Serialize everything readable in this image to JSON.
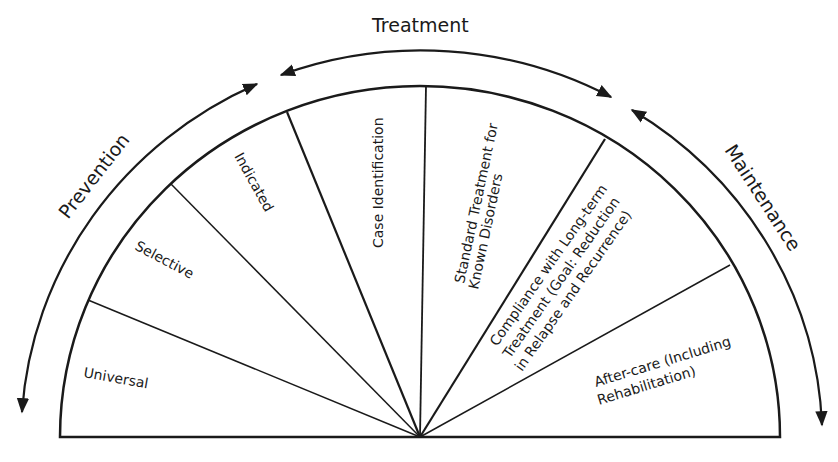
{
  "diagram": {
    "type": "semicircular spectrum diagram",
    "phases": [
      {
        "id": "prevention",
        "label": "Prevention"
      },
      {
        "id": "treatment",
        "label": "Treatment"
      },
      {
        "id": "maintenance",
        "label": "Maintenance"
      }
    ],
    "segments": [
      {
        "id": "universal",
        "lines": [
          "Universal"
        ]
      },
      {
        "id": "selective",
        "lines": [
          "Selective"
        ]
      },
      {
        "id": "indicated",
        "lines": [
          "Indicated"
        ]
      },
      {
        "id": "case-identification",
        "lines": [
          "Case Identification"
        ]
      },
      {
        "id": "standard-treatment",
        "lines": [
          "Standard Treatment for",
          "Known Disorders"
        ]
      },
      {
        "id": "compliance",
        "lines": [
          "Compliance with Long-term",
          "Treatment (Goal: Reduction",
          "in Relapse and Recurrence)"
        ]
      },
      {
        "id": "after-care",
        "lines": [
          "After-care (Including",
          "Rehabilitation)"
        ]
      }
    ],
    "colors": {
      "stroke": "#1a1a1a",
      "background": "#ffffff"
    }
  }
}
